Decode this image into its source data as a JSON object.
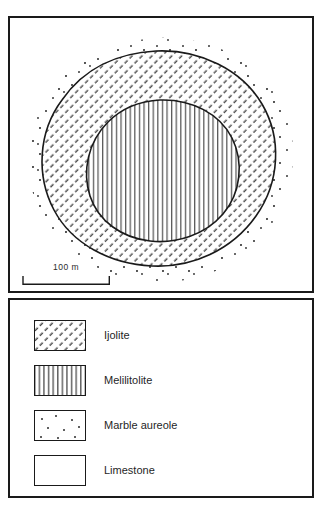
{
  "figure": {
    "header_remnant": "",
    "map": {
      "scale_bar": {
        "label": "100 m",
        "length_px": 88,
        "represents_meters": 100
      },
      "units": [
        {
          "name": "Marble aureole",
          "pattern": "dots",
          "position": "outermost halo around intrusion"
        },
        {
          "name": "Ijolite",
          "pattern": "diagonal-hatch",
          "position": "outer ring of intrusion"
        },
        {
          "name": "Melilitolite",
          "pattern": "vertical-lines",
          "position": "core of intrusion"
        },
        {
          "name": "Limestone",
          "pattern": "blank",
          "position": "country rock / background"
        }
      ]
    },
    "legend": {
      "items": [
        {
          "label": "Ijolite",
          "pattern": "diagonal-hatch"
        },
        {
          "label": "Melilitolite",
          "pattern": "vertical-lines"
        },
        {
          "label": "Marble aureole",
          "pattern": "dots"
        },
        {
          "label": "Limestone",
          "pattern": "blank"
        }
      ]
    },
    "colors": {
      "ink": "#1a1a1a",
      "paper": "#ffffff",
      "hatch": "#3a3a3a"
    }
  }
}
